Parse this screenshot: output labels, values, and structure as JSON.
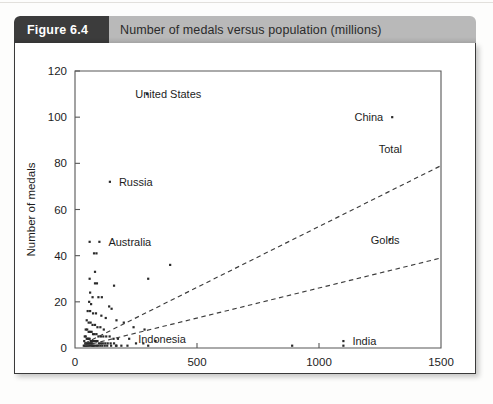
{
  "figure": {
    "number_label": "Figure 6.4",
    "title": "Number of medals versus population (millions)"
  },
  "chart_data": {
    "type": "scatter",
    "title": "Number of medals versus population (millions)",
    "xlabel": "Population (millions)",
    "ylabel": "Number of medals",
    "xlim": [
      0,
      1500
    ],
    "ylim": [
      0,
      120
    ],
    "xticks": [
      0,
      500,
      1000,
      1500
    ],
    "yticks": [
      0,
      20,
      40,
      60,
      80,
      100,
      120
    ],
    "grid": false,
    "legend_position": "inline-annotations",
    "annotations": [
      {
        "text": "United States",
        "x": 210,
        "y": 110,
        "anchor": "left-of-text"
      },
      {
        "text": "China",
        "x": 1300,
        "y": 100,
        "anchor": "right-of-text"
      },
      {
        "text": "Russia",
        "x": 143,
        "y": 72,
        "anchor": "left-of-text"
      },
      {
        "text": "Australia",
        "x": 100,
        "y": 46,
        "anchor": "left-of-text"
      },
      {
        "text": "Indonesia",
        "x": 222,
        "y": 4,
        "anchor": "left-of-text"
      },
      {
        "text": "India",
        "x": 1100,
        "y": 3,
        "anchor": "left-of-text"
      },
      {
        "text": "Total",
        "x": 1340,
        "y": 86,
        "anchor": "line-label"
      },
      {
        "text": "Golds",
        "x": 1330,
        "y": 47,
        "anchor": "line-label"
      }
    ],
    "trend_lines": [
      {
        "name": "Total",
        "x": [
          40,
          1500
        ],
        "y": [
          2,
          79
        ]
      },
      {
        "name": "Golds",
        "x": [
          40,
          1500
        ],
        "y": [
          1,
          39
        ]
      }
    ],
    "series": [
      {
        "name": "Countries (total medals vs population)",
        "points": [
          [
            295,
            110
          ],
          [
            1300,
            100
          ],
          [
            143,
            72
          ],
          [
            100,
            46
          ],
          [
            60,
            46
          ],
          [
            78,
            41
          ],
          [
            88,
            41
          ],
          [
            82,
            33
          ],
          [
            60,
            30
          ],
          [
            82,
            28
          ],
          [
            90,
            28
          ],
          [
            390,
            36
          ],
          [
            300,
            30
          ],
          [
            160,
            27
          ],
          [
            62,
            24
          ],
          [
            72,
            22
          ],
          [
            96,
            22
          ],
          [
            110,
            22
          ],
          [
            58,
            20
          ],
          [
            66,
            19
          ],
          [
            140,
            18
          ],
          [
            150,
            17
          ],
          [
            52,
            16
          ],
          [
            62,
            16
          ],
          [
            74,
            15
          ],
          [
            86,
            15
          ],
          [
            108,
            14
          ],
          [
            126,
            13
          ],
          [
            170,
            12
          ],
          [
            48,
            12
          ],
          [
            56,
            11
          ],
          [
            64,
            11
          ],
          [
            72,
            10
          ],
          [
            82,
            10
          ],
          [
            92,
            9
          ],
          [
            104,
            9
          ],
          [
            118,
            8
          ],
          [
            200,
            11
          ],
          [
            240,
            9
          ],
          [
            285,
            8
          ],
          [
            44,
            8
          ],
          [
            50,
            8
          ],
          [
            56,
            7
          ],
          [
            62,
            7
          ],
          [
            68,
            7
          ],
          [
            74,
            6
          ],
          [
            80,
            6
          ],
          [
            88,
            6
          ],
          [
            96,
            5
          ],
          [
            106,
            5
          ],
          [
            116,
            5
          ],
          [
            128,
            5
          ],
          [
            142,
            5
          ],
          [
            158,
            4
          ],
          [
            176,
            4
          ],
          [
            40,
            5
          ],
          [
            44,
            5
          ],
          [
            48,
            4
          ],
          [
            52,
            4
          ],
          [
            56,
            4
          ],
          [
            60,
            4
          ],
          [
            64,
            3
          ],
          [
            68,
            3
          ],
          [
            72,
            3
          ],
          [
            76,
            3
          ],
          [
            80,
            3
          ],
          [
            86,
            3
          ],
          [
            92,
            3
          ],
          [
            98,
            2
          ],
          [
            106,
            2
          ],
          [
            114,
            2
          ],
          [
            124,
            2
          ],
          [
            134,
            2
          ],
          [
            146,
            2
          ],
          [
            160,
            2
          ],
          [
            38,
            3
          ],
          [
            42,
            2
          ],
          [
            46,
            2
          ],
          [
            50,
            2
          ],
          [
            54,
            2
          ],
          [
            58,
            2
          ],
          [
            62,
            2
          ],
          [
            66,
            2
          ],
          [
            70,
            2
          ],
          [
            74,
            1
          ],
          [
            78,
            1
          ],
          [
            84,
            1
          ],
          [
            90,
            1
          ],
          [
            96,
            1
          ],
          [
            104,
            1
          ],
          [
            112,
            1
          ],
          [
            122,
            1
          ],
          [
            132,
            1
          ],
          [
            148,
            1
          ],
          [
            168,
            1
          ],
          [
            190,
            1
          ],
          [
            215,
            1
          ],
          [
            222,
            4
          ],
          [
            250,
            2
          ],
          [
            280,
            2
          ],
          [
            300,
            1
          ],
          [
            330,
            3
          ],
          [
            1100,
            3
          ],
          [
            1100,
            1
          ],
          [
            1290,
            47
          ],
          [
            890,
            1
          ],
          [
            170,
            1
          ],
          [
            36,
            1
          ],
          [
            40,
            1
          ],
          [
            44,
            1
          ],
          [
            48,
            1
          ],
          [
            52,
            1
          ],
          [
            58,
            1
          ],
          [
            64,
            1
          ],
          [
            70,
            1
          ]
        ]
      }
    ]
  }
}
